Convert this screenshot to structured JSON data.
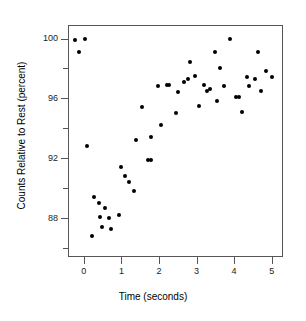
{
  "chart_data": {
    "type": "scatter",
    "title": "",
    "xlabel": "Time (seconds)",
    "ylabel": "Counts Relative to Rest (percent)",
    "xlim": [
      -0.42,
      5.3
    ],
    "ylim": [
      85.4,
      100.9
    ],
    "xticks": [
      0,
      1,
      2,
      3,
      4,
      5
    ],
    "xtick_labels": [
      "0",
      "1",
      "2",
      "3",
      "4",
      "5"
    ],
    "yticks": [
      88,
      92,
      96,
      100
    ],
    "ytick_labels": [
      "88",
      "92",
      "96",
      "100"
    ],
    "yticks_minor": [
      86,
      90,
      94,
      98
    ],
    "grid": false,
    "legend": null,
    "marker": "filled-circle",
    "marker_color": "#000000",
    "axis_color": "#555555",
    "background_color": "#ffffff",
    "points": [
      {
        "x": -0.24,
        "y": 99.9
      },
      {
        "x": 0.03,
        "y": 100.0
      },
      {
        "x": -0.13,
        "y": 99.1
      },
      {
        "x": 0.09,
        "y": 92.8
      },
      {
        "x": 0.22,
        "y": 86.8
      },
      {
        "x": 0.28,
        "y": 89.4
      },
      {
        "x": 0.4,
        "y": 89.0
      },
      {
        "x": 0.44,
        "y": 88.1
      },
      {
        "x": 0.48,
        "y": 87.4
      },
      {
        "x": 0.57,
        "y": 88.7
      },
      {
        "x": 0.68,
        "y": 88.0
      },
      {
        "x": 0.72,
        "y": 87.3
      },
      {
        "x": 0.93,
        "y": 88.2
      },
      {
        "x": 0.98,
        "y": 91.4
      },
      {
        "x": 1.1,
        "y": 90.8
      },
      {
        "x": 1.2,
        "y": 90.4
      },
      {
        "x": 1.33,
        "y": 89.8
      },
      {
        "x": 1.38,
        "y": 93.2
      },
      {
        "x": 1.55,
        "y": 95.4
      },
      {
        "x": 1.72,
        "y": 91.9
      },
      {
        "x": 1.79,
        "y": 91.9
      },
      {
        "x": 1.8,
        "y": 93.4
      },
      {
        "x": 1.97,
        "y": 96.8
      },
      {
        "x": 2.05,
        "y": 94.2
      },
      {
        "x": 2.2,
        "y": 96.9
      },
      {
        "x": 2.27,
        "y": 96.9
      },
      {
        "x": 2.44,
        "y": 95.0
      },
      {
        "x": 2.5,
        "y": 96.4
      },
      {
        "x": 2.66,
        "y": 97.1
      },
      {
        "x": 2.76,
        "y": 97.3
      },
      {
        "x": 2.82,
        "y": 98.4
      },
      {
        "x": 2.95,
        "y": 97.5
      },
      {
        "x": 3.07,
        "y": 95.5
      },
      {
        "x": 3.2,
        "y": 96.9
      },
      {
        "x": 3.28,
        "y": 96.5
      },
      {
        "x": 3.36,
        "y": 96.6
      },
      {
        "x": 3.5,
        "y": 99.1
      },
      {
        "x": 3.55,
        "y": 95.8
      },
      {
        "x": 3.62,
        "y": 98.0
      },
      {
        "x": 3.72,
        "y": 96.8
      },
      {
        "x": 3.9,
        "y": 100.0
      },
      {
        "x": 4.05,
        "y": 96.1
      },
      {
        "x": 4.12,
        "y": 96.1
      },
      {
        "x": 4.22,
        "y": 95.1
      },
      {
        "x": 4.33,
        "y": 97.4
      },
      {
        "x": 4.4,
        "y": 96.8
      },
      {
        "x": 4.56,
        "y": 97.3
      },
      {
        "x": 4.63,
        "y": 99.1
      },
      {
        "x": 4.72,
        "y": 96.5
      },
      {
        "x": 4.85,
        "y": 97.8
      },
      {
        "x": 5.0,
        "y": 97.4
      }
    ]
  }
}
